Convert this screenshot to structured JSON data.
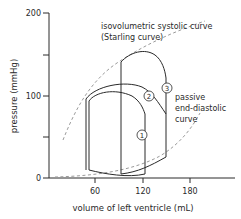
{
  "figure": {
    "type": "pressure-volume loops",
    "y_axis": {
      "label": "pressure (mmHg)",
      "ticks": [
        "200",
        "100",
        "0"
      ],
      "minor_ticks": [
        150,
        50
      ],
      "range": [
        0,
        200
      ]
    },
    "x_axis": {
      "label": "volume of left ventricle (mL)",
      "ticks": [
        "60",
        "120",
        "180"
      ]
    },
    "annotations": {
      "systolic_line1": "isovolumetric systolic curve",
      "systolic_line2": "(Starling curve)",
      "diastolic_line1": "passive",
      "diastolic_line2": "end-diastolic",
      "diastolic_line3": "curve"
    },
    "loops": [
      {
        "id": "1",
        "label": "1"
      },
      {
        "id": "2",
        "label": "2"
      },
      {
        "id": "3",
        "label": "3"
      }
    ],
    "colors": {
      "line": "#2a2a2a",
      "dashed": "#9a9a9a"
    }
  }
}
